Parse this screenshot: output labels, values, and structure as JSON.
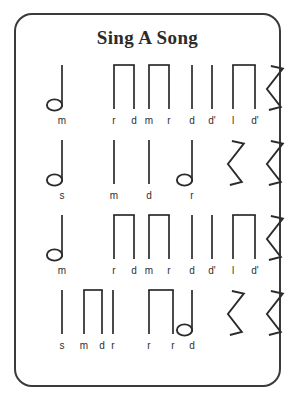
{
  "card": {
    "title": "Sing A Song",
    "border_color": "#3a3a3a",
    "ink_color": "#2b2b2b",
    "background_color": "#ffffff"
  },
  "rows": [
    {
      "id": "row-1",
      "labels": [
        "m",
        "r",
        "d",
        "m",
        "r",
        "d",
        "d'",
        "l",
        "d'"
      ],
      "label_x": [
        46,
        98,
        118,
        133,
        153,
        176,
        196,
        217,
        239
      ],
      "notes": [
        {
          "kind": "half-note",
          "x": 46
        },
        {
          "kind": "beamed-pair",
          "x1": 98,
          "x2": 118
        },
        {
          "kind": "beamed-pair",
          "x1": 133,
          "x2": 153
        },
        {
          "kind": "stem",
          "x": 176
        },
        {
          "kind": "stem",
          "x": 196
        },
        {
          "kind": "beamed-pair",
          "x1": 217,
          "x2": 239
        },
        {
          "kind": "quarter-rest",
          "x": 258
        }
      ]
    },
    {
      "id": "row-2",
      "labels": [
        "s",
        "m",
        "d",
        "r"
      ],
      "label_x": [
        46,
        98,
        133,
        176
      ],
      "notes": [
        {
          "kind": "half-note",
          "x": 46
        },
        {
          "kind": "stem",
          "x": 98
        },
        {
          "kind": "stem",
          "x": 133
        },
        {
          "kind": "half-note",
          "x": 176
        },
        {
          "kind": "quarter-rest",
          "x": 219
        },
        {
          "kind": "quarter-rest",
          "x": 258
        }
      ]
    },
    {
      "id": "row-3",
      "labels": [
        "m",
        "r",
        "d",
        "m",
        "r",
        "d",
        "d'",
        "l",
        "d'"
      ],
      "label_x": [
        46,
        98,
        118,
        133,
        153,
        176,
        196,
        217,
        239
      ],
      "notes": [
        {
          "kind": "half-note",
          "x": 46
        },
        {
          "kind": "beamed-pair",
          "x1": 98,
          "x2": 118
        },
        {
          "kind": "beamed-pair",
          "x1": 133,
          "x2": 153
        },
        {
          "kind": "stem",
          "x": 176
        },
        {
          "kind": "stem",
          "x": 196
        },
        {
          "kind": "beamed-pair",
          "x1": 217,
          "x2": 239
        },
        {
          "kind": "quarter-rest",
          "x": 258
        }
      ]
    },
    {
      "id": "row-4",
      "labels": [
        "s",
        "m",
        "d",
        "r",
        "r",
        "r",
        "d"
      ],
      "label_x": [
        46,
        68,
        86,
        97,
        133,
        157,
        176
      ],
      "notes": [
        {
          "kind": "stem",
          "x": 46
        },
        {
          "kind": "beamed-pair",
          "x1": 68,
          "x2": 86
        },
        {
          "kind": "stem",
          "x": 97
        },
        {
          "kind": "beamed-pair",
          "x1": 133,
          "x2": 157
        },
        {
          "kind": "half-note",
          "x": 176
        },
        {
          "kind": "quarter-rest",
          "x": 219
        },
        {
          "kind": "quarter-rest",
          "x": 258
        }
      ]
    }
  ]
}
